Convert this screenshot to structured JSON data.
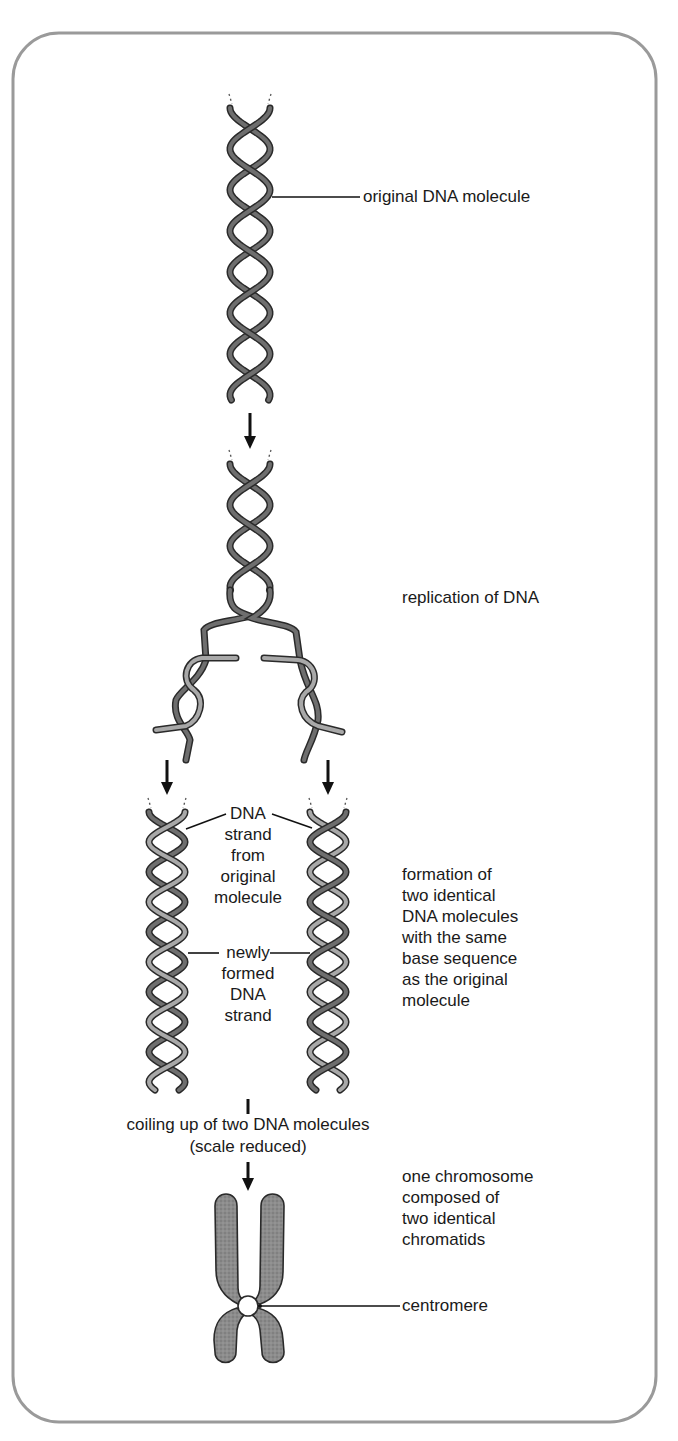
{
  "diagram": {
    "type": "process-flow",
    "colors": {
      "frame": "#9a9a9a",
      "original_strand": "#6e6e6e",
      "new_strand": "#a8a8a8",
      "strand_outline": "#2a2a2a",
      "chromosome": "#8a8a8a",
      "text": "#1a1a1a"
    },
    "stages": [
      {
        "id": "original",
        "label": "original DNA molecule"
      },
      {
        "id": "replication",
        "label": "replication of DNA"
      },
      {
        "id": "two-molecules",
        "label": "formation of\ntwo identical\nDNA molecules\nwith the same\nbase sequence\nas the original\nmolecule"
      },
      {
        "id": "coiling",
        "label": "coiling up of two DNA molecules",
        "sublabel": "(scale reduced)"
      },
      {
        "id": "chromosome",
        "label": "one chromosome\ncomposed of\ntwo identical\nchromatids"
      }
    ],
    "callouts": {
      "original_strand": "DNA\nstrand\nfrom\noriginal\nmolecule",
      "new_strand": "newly\nformed\nDNA\nstrand",
      "centromere": "centromere"
    }
  }
}
